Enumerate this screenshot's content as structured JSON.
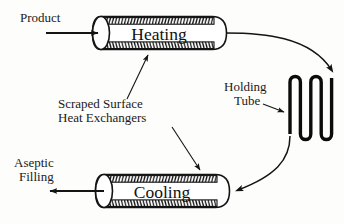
{
  "diagram": {
    "background_color": "#fdfdfc",
    "line_color": "#141414",
    "units": [
      {
        "id": "heating",
        "label": "Heating",
        "type": "scraped-surface-heat-exchanger",
        "position": "top"
      },
      {
        "id": "cooling",
        "label": "Cooling",
        "type": "scraped-surface-heat-exchanger",
        "position": "bottom"
      }
    ],
    "labels": {
      "product": "Product",
      "aseptic_filling_line1": "Aseptic",
      "aseptic_filling_line2": "Filling",
      "scraped_surface_line1": "Scraped Surface",
      "scraped_surface_line2": "Heat Exchangers",
      "holding_tube_line1": "Holding",
      "holding_tube_line2": "Tube"
    },
    "flow": {
      "inlet": "Product",
      "outlet": "Aseptic Filling",
      "sequence": [
        "Product",
        "Heating",
        "Holding Tube",
        "Cooling",
        "Aseptic Filling"
      ]
    },
    "holding_tube": {
      "id": "holding-tube",
      "shape": "serpentine-coil",
      "passes": 5
    }
  }
}
